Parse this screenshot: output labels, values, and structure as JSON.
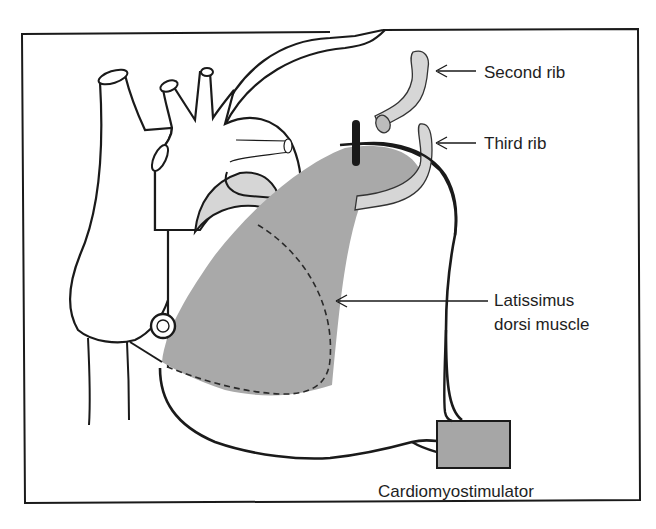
{
  "figure": {
    "labels": {
      "second_rib": "Second rib",
      "third_rib": "Third rib",
      "muscle_line1": "Latissimus",
      "muscle_line2": "dorsi muscle",
      "stimulator": "Cardiomyostimulator"
    },
    "colors": {
      "outline": "#1a1a1a",
      "muscle_fill": "#a9a9a9",
      "rib_fill": "#d6d6d6",
      "stimulator_fill": "#a6a6a6",
      "background": "#ffffff"
    }
  }
}
